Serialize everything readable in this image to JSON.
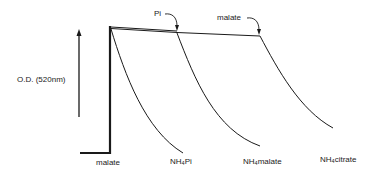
{
  "diagram": {
    "y_axis_label": "O.D. (520nm)",
    "annotations": [
      {
        "label": "Pi",
        "points_to": "first addition point"
      },
      {
        "label": "malate",
        "points_to": "second addition point"
      }
    ],
    "x_labels": [
      {
        "text": "malate"
      },
      {
        "prefix": "NH",
        "sub": "4",
        "suffix": "Pi"
      },
      {
        "prefix": "NH",
        "sub": "4",
        "suffix": "malate"
      },
      {
        "prefix": "NH",
        "sub": "4",
        "suffix": "citrate"
      }
    ],
    "colors": {
      "line": "#1a1a1a",
      "background": "#ffffff"
    }
  }
}
